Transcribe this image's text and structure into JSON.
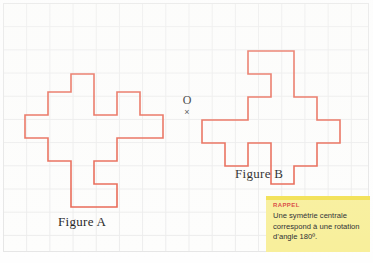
{
  "page": {
    "width": 373,
    "height": 263,
    "background_color": "#fefefe"
  },
  "grid": {
    "cell_size_px": 23.2,
    "line_color": "#ececec",
    "columns": 16,
    "rows": 11
  },
  "colors": {
    "figure_stroke": "#e8614d",
    "grid_line": "#ececec",
    "rappel_background": "#f8ef9a",
    "rappel_title": "#d8453a",
    "text": "#1a1a1a"
  },
  "center_point": {
    "label": "O",
    "marker": "×",
    "name": "centre-of-symmetry"
  },
  "figures": [
    {
      "id": "figure-a",
      "label": "Figure A",
      "shape": "pinwheel-polygon",
      "cells_across": 6,
      "cells_down": 6,
      "path": "M 0,41 L 23,41 L 23,18 L 46,18 L 46,0 L 69,0 L 69,41 L 92,41 L 92,18 L 115,18 L 115,41 L 138,41 L 138,64 L 92,64 L 92,87 L 69,87 L 69,110 L 92,110 L 92,133 L 46,133 L 46,87 L 23,87 L 23,64 L 0,64 Z"
    },
    {
      "id": "figure-b",
      "label": "Figure B",
      "shape": "pinwheel-polygon",
      "cells_across": 6,
      "cells_down": 6,
      "path": "M 138,92 L 115,92 L 115,115 L 92,115 L 92,133 L 69,133 L 69,92 L 46,92 L 46,115 L 23,115 L 23,92 L 0,92 L 0,69 L 46,69 L 46,46 L 69,46 L 69,23 L 46,23 L 46,0 L 92,0 L 92,46 L 115,46 L 115,69 L 138,69 Z"
    }
  ],
  "rappel": {
    "title": "RAPPEL",
    "text": "Une symétrie centrale correspond à une rotation d’angle 180º."
  }
}
